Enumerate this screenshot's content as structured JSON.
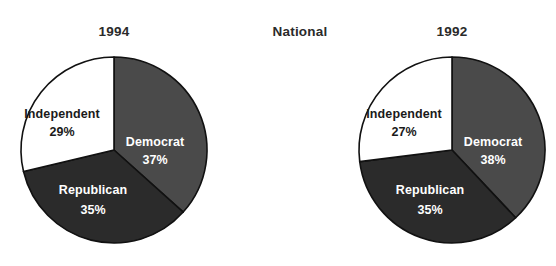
{
  "figure": {
    "center_label": "National",
    "background_color": "#ffffff"
  },
  "palette": {
    "democrat": "#4a4a4a",
    "republican": "#2b2b2b",
    "independent": "#ffffff",
    "outline": "#111111",
    "text_dark": "#1a1a1a",
    "text_light": "#ffffff"
  },
  "left": {
    "title": "1994",
    "labels": {
      "independent_name": "Independent",
      "independent_value": "29%",
      "democrat_name": "Democrat",
      "democrat_value": "37%",
      "republican_name": "Republican",
      "republican_value": "35%"
    }
  },
  "right": {
    "title": "1992",
    "labels": {
      "independent_name": "Independent",
      "independent_value": "27%",
      "democrat_name": "Democrat",
      "democrat_value": "38%",
      "republican_name": "Republican",
      "republican_value": "35%"
    }
  },
  "chart_data": [
    {
      "type": "pie",
      "title": "1994",
      "supertitle": "National",
      "categories": [
        "Democrat",
        "Republican",
        "Independent"
      ],
      "values": [
        37,
        35,
        29
      ],
      "value_labels": [
        "37%",
        "35%",
        "29%"
      ],
      "units": "percent",
      "colors": [
        "#4a4a4a",
        "#2b2b2b",
        "#ffffff"
      ],
      "start_angle_deg": 0,
      "direction": "clockwise",
      "legend": "none",
      "labels_inside_slices": true,
      "xlabel": "",
      "ylabel": ""
    },
    {
      "type": "pie",
      "title": "1992",
      "supertitle": "National",
      "categories": [
        "Democrat",
        "Republican",
        "Independent"
      ],
      "values": [
        38,
        35,
        27
      ],
      "value_labels": [
        "38%",
        "35%",
        "27%"
      ],
      "units": "percent",
      "colors": [
        "#4a4a4a",
        "#2b2b2b",
        "#ffffff"
      ],
      "start_angle_deg": 0,
      "direction": "clockwise",
      "legend": "none",
      "labels_inside_slices": true,
      "xlabel": "",
      "ylabel": ""
    }
  ]
}
